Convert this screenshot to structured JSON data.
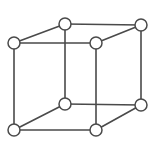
{
  "figure": {
    "background_color": "#ffffff",
    "line_color": "#4a4a4a",
    "node_fill_color": "#ffffff",
    "node_stroke_color": "#4a4a4a",
    "line_width": 1.6,
    "node_radius": 6,
    "canvas": {
      "width": 154,
      "height": 152
    }
  },
  "chart_data": {
    "type": "diagram",
    "diagram_kind": "cubic-unit-cell",
    "projection": "oblique",
    "node_count": 8,
    "edge_count": 12,
    "nodes": [
      {
        "id": "front-top-left",
        "label": "",
        "x": 14,
        "y": 43
      },
      {
        "id": "front-top-right",
        "label": "",
        "x": 96,
        "y": 43
      },
      {
        "id": "front-bottom-left",
        "label": "",
        "x": 14,
        "y": 130
      },
      {
        "id": "front-bottom-right",
        "label": "",
        "x": 96,
        "y": 130
      },
      {
        "id": "back-top-left",
        "label": "",
        "x": 65,
        "y": 24
      },
      {
        "id": "back-top-right",
        "label": "",
        "x": 141,
        "y": 25
      },
      {
        "id": "back-bottom-left",
        "label": "",
        "x": 65,
        "y": 104
      },
      {
        "id": "back-bottom-right",
        "label": "",
        "x": 141,
        "y": 105
      }
    ],
    "edges": [
      {
        "id": "front-top",
        "from": "front-top-left",
        "to": "front-top-right"
      },
      {
        "id": "front-bottom",
        "from": "front-bottom-left",
        "to": "front-bottom-right"
      },
      {
        "id": "front-left",
        "from": "front-top-left",
        "to": "front-bottom-left"
      },
      {
        "id": "front-right",
        "from": "front-top-right",
        "to": "front-bottom-right"
      },
      {
        "id": "back-top",
        "from": "back-top-left",
        "to": "back-top-right"
      },
      {
        "id": "back-bottom",
        "from": "back-bottom-left",
        "to": "back-bottom-right"
      },
      {
        "id": "back-left",
        "from": "back-top-left",
        "to": "back-bottom-left"
      },
      {
        "id": "back-right",
        "from": "back-top-right",
        "to": "back-bottom-right"
      },
      {
        "id": "depth-top-left",
        "from": "front-top-left",
        "to": "back-top-left"
      },
      {
        "id": "depth-top-right",
        "from": "front-top-right",
        "to": "back-top-right"
      },
      {
        "id": "depth-bottom-left",
        "from": "front-bottom-left",
        "to": "back-bottom-left"
      },
      {
        "id": "depth-bottom-right",
        "from": "front-bottom-right",
        "to": "back-bottom-right"
      }
    ],
    "labels": [],
    "legend": [],
    "axes": null,
    "grid": false
  }
}
